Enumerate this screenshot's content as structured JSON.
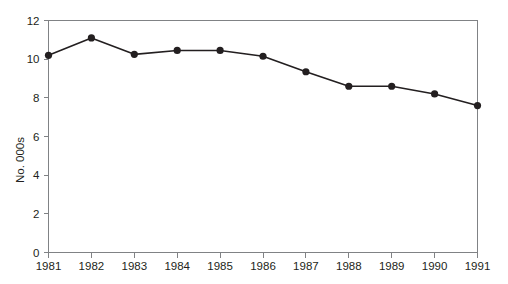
{
  "chart_data": {
    "type": "line",
    "title": "",
    "xlabel": "",
    "ylabel": "No. 000s",
    "categories": [
      "1981",
      "1982",
      "1983",
      "1984",
      "1985",
      "1986",
      "1987",
      "1988",
      "1989",
      "1990",
      "1991"
    ],
    "values": [
      10.2,
      11.1,
      10.25,
      10.45,
      10.45,
      10.15,
      9.35,
      8.6,
      8.6,
      8.2,
      7.6
    ],
    "series": [
      {
        "name": "No. 000s",
        "values": [
          10.2,
          11.1,
          10.25,
          10.45,
          10.45,
          10.15,
          9.35,
          8.6,
          8.6,
          8.2,
          7.6
        ]
      }
    ],
    "ylim": [
      0,
      12
    ],
    "yticks": [
      0,
      2,
      4,
      6,
      8,
      10,
      12
    ],
    "ytick_labels": [
      "0",
      "2",
      "4",
      "6",
      "8",
      "10",
      "12"
    ],
    "xtick_labels": [
      "1981",
      "1982",
      "1983",
      "1984",
      "1985",
      "1986",
      "1987",
      "1988",
      "1989",
      "1990",
      "1991"
    ],
    "grid": false,
    "legend": false,
    "legend_position": "none",
    "marker": "circle",
    "line_color": "#231f20",
    "marker_color": "#231f20",
    "frame_color": "#808285",
    "background_color": "#ffffff"
  }
}
